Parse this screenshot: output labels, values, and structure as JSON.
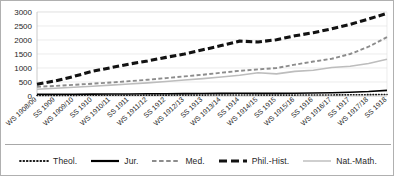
{
  "chart_data": {
    "type": "line",
    "title": "",
    "xlabel": "",
    "ylabel": "",
    "ylim": [
      0,
      3000
    ],
    "yticks": [
      0,
      500,
      1000,
      1500,
      2000,
      2500,
      3000
    ],
    "grid": true,
    "legend_position": "bottom",
    "categories": [
      "WS 1908/09",
      "SS 1909",
      "WS 1909/10",
      "SS 1910",
      "WS 1910/11",
      "SS 1911",
      "WS 1911/12",
      "SS 1912",
      "WS 1912/13",
      "SS 1913",
      "WS 1913/14",
      "SS 1914",
      "WS 1914/15",
      "SS 1915",
      "WS 1915/16",
      "SS 1916",
      "WS 1916/17",
      "SS 1917",
      "WS 1917/18",
      "SS 1918"
    ],
    "series": [
      {
        "name": "Theol.",
        "style": "dotted",
        "color": "#1a1a1a",
        "values": [
          20,
          22,
          24,
          25,
          27,
          28,
          30,
          31,
          32,
          33,
          34,
          35,
          33,
          32,
          33,
          35,
          38,
          42,
          48,
          55
        ]
      },
      {
        "name": "Jur.",
        "style": "solid",
        "color": "#000000",
        "values": [
          60,
          62,
          65,
          68,
          70,
          74,
          78,
          82,
          86,
          90,
          94,
          98,
          95,
          93,
          96,
          105,
          118,
          135,
          160,
          200
        ]
      },
      {
        "name": "Med.",
        "style": "dashed",
        "color": "#8c8c8c",
        "values": [
          330,
          360,
          400,
          440,
          480,
          530,
          580,
          640,
          700,
          760,
          830,
          900,
          950,
          1000,
          1120,
          1230,
          1330,
          1500,
          1760,
          2100
        ]
      },
      {
        "name": "Phil.-Hist.",
        "style": "thick-dashed",
        "color": "#121212",
        "values": [
          420,
          540,
          700,
          880,
          1010,
          1140,
          1250,
          1380,
          1500,
          1650,
          1800,
          1960,
          1930,
          2010,
          2150,
          2260,
          2400,
          2560,
          2750,
          2950
        ]
      },
      {
        "name": "Nat.-Math.",
        "style": "solid-light",
        "color": "#bdbdbd",
        "values": [
          240,
          275,
          310,
          350,
          390,
          430,
          470,
          520,
          570,
          620,
          680,
          740,
          830,
          790,
          880,
          920,
          1020,
          1060,
          1160,
          1310
        ]
      }
    ]
  },
  "legend": {
    "items": [
      {
        "label": "Theol.",
        "icon": "dotted-line-swatch"
      },
      {
        "label": "Jur.",
        "icon": "solid-line-swatch"
      },
      {
        "label": "Med.",
        "icon": "dashed-line-swatch"
      },
      {
        "label": "Phil.-Hist.",
        "icon": "thick-dashed-line-swatch"
      },
      {
        "label": "Nat.-Math.",
        "icon": "light-solid-line-swatch"
      }
    ]
  }
}
